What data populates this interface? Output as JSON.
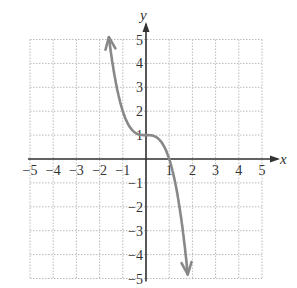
{
  "chart_data": {
    "type": "line",
    "title": "",
    "xlabel": "x",
    "ylabel": "y",
    "xlim": [
      -5,
      5
    ],
    "ylim": [
      -5,
      5
    ],
    "grid": true,
    "x_ticks": [
      "-5",
      "-4",
      "-3",
      "-2",
      "-1",
      "1",
      "2",
      "3",
      "4",
      "5"
    ],
    "y_ticks": [
      "5",
      "4",
      "3",
      "2",
      "1",
      "-1",
      "-2",
      "-3",
      "-4",
      "-5"
    ],
    "series": [
      {
        "name": "f(x) = -x^3 + 1",
        "x": [
          -1.6,
          -1.4,
          -1.2,
          -1.0,
          -0.8,
          -0.6,
          -0.4,
          -0.2,
          0,
          0.2,
          0.4,
          0.6,
          0.8,
          1.0,
          1.2,
          1.4,
          1.6,
          1.8
        ],
        "y": [
          5.1,
          3.74,
          2.73,
          2.0,
          1.51,
          1.22,
          1.06,
          1.01,
          1.0,
          0.99,
          0.94,
          0.78,
          0.49,
          0.0,
          -0.73,
          -1.74,
          -3.1,
          -4.83
        ],
        "color": "#888888",
        "arrows": "both"
      }
    ]
  }
}
